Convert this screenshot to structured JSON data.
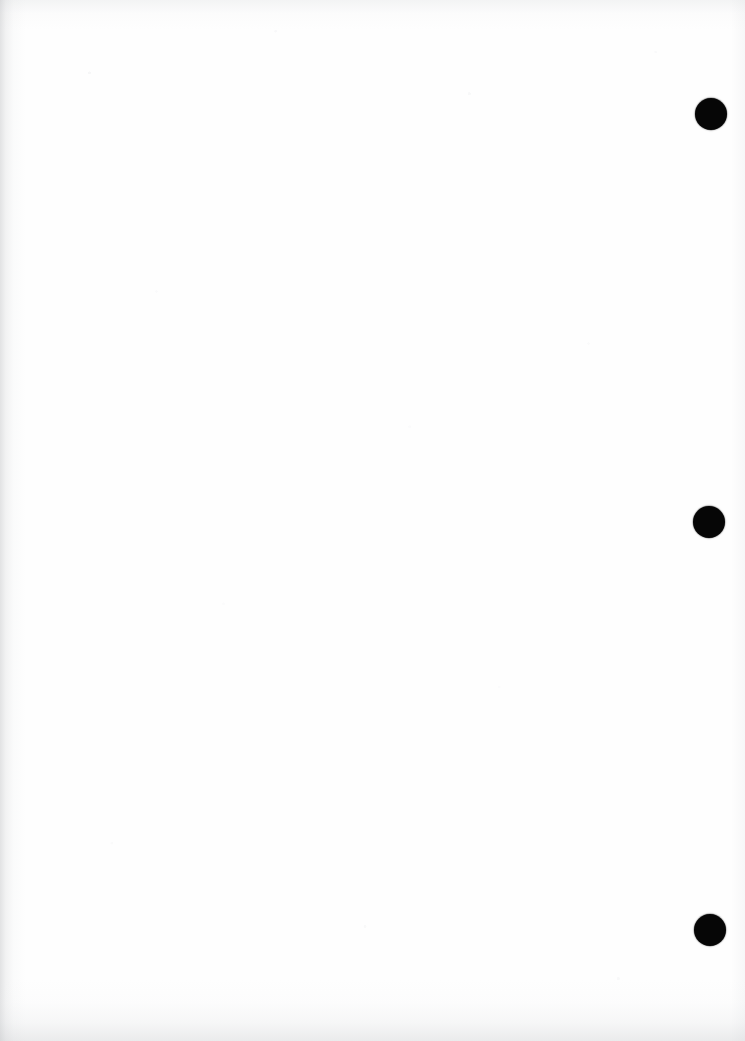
{
  "document": {
    "title": "Scanned Blank Page",
    "kind": "scanned-document-page",
    "page_width": 745,
    "page_height": 1041,
    "body_text": "",
    "paper_color": "#fefefe",
    "ink_color": "#060606",
    "edge_shadow_color": "#c4c6c9"
  },
  "marks": {
    "label": "right-margin ink dots",
    "count": 3,
    "shape": "filled-circle",
    "color": "#060606",
    "items": [
      {
        "name": "ink-dot-1",
        "cx": 711,
        "cy": 114,
        "diameter": 32
      },
      {
        "name": "ink-dot-2",
        "cx": 709,
        "cy": 522,
        "diameter": 32
      },
      {
        "name": "ink-dot-3",
        "cx": 710,
        "cy": 930,
        "diameter": 32
      }
    ]
  },
  "artifacts": {
    "left_edge_shadow": true,
    "bottom_edge_shadow": true,
    "top_edge_speckle": true,
    "right_edge_shadow": true,
    "paper_speckle": true
  }
}
